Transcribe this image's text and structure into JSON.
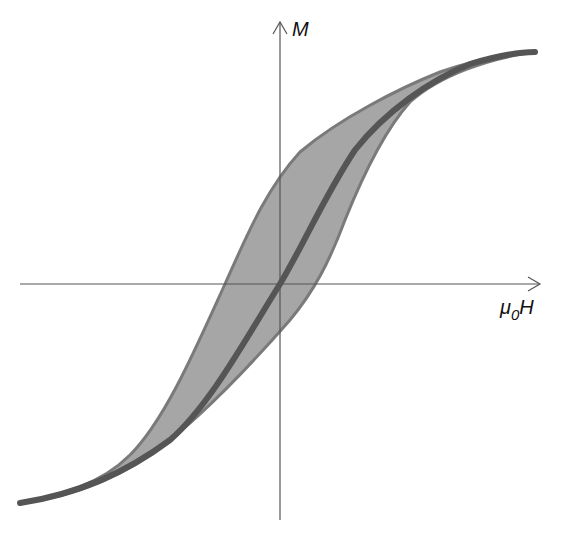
{
  "diagram": {
    "axes": {
      "y_label": "M",
      "x_label_main": "μ",
      "x_label_sub": "0",
      "x_label_tail": "H",
      "color": "#555555"
    },
    "colors": {
      "loop_fill": "#a6a6a6",
      "loop_edge": "#7a7a7a",
      "center_curve": "#555555",
      "background": "#ffffff"
    },
    "curves": {
      "upper_branch": "M 20 503 C 60 495, 100 485, 130 455 C 165 420, 195 350, 225 284 C 245 240, 265 190, 300 152 C 340 118, 400 88, 440 72 C 480 58, 510 54, 535 52",
      "lower_branch": "M 20 503 C 70 497, 110 482, 150 455 C 200 420, 255 360, 290 320 C 315 290, 330 260, 345 220 C 365 170, 385 130, 410 102 C 440 75, 490 58, 535 52",
      "center_curve": "M 20 503 C 80 494, 130 470, 170 440 C 210 405, 245 340, 280 284 C 305 242, 325 195, 355 150 C 385 112, 430 80, 470 64 C 500 55, 520 52, 535 52"
    }
  }
}
